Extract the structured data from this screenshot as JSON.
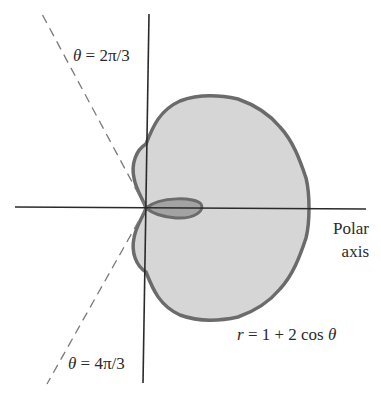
{
  "diagram": {
    "type": "polar-curve",
    "equation_label": "r = 1 + 2 cos θ",
    "equation": {
      "r_var": "r",
      "eq": " = 1 + 2 cos ",
      "theta": "θ"
    },
    "axis_label": {
      "line1": "Polar",
      "line2": "axis"
    },
    "rays": [
      {
        "name": "upper-ray",
        "label": {
          "theta": "θ",
          "rest": " = 2π/3"
        },
        "angle": "2π/3"
      },
      {
        "name": "lower-ray",
        "label": {
          "theta": "θ",
          "rest": " = 4π/3"
        },
        "angle": "4π/3"
      }
    ],
    "colors": {
      "outer_fill": "#d6d6d6",
      "inner_fill": "#a3a3a3",
      "curve_stroke": "#6b6b6b",
      "axis": "#2a2a2a",
      "dashed_ray": "#7a7a7a"
    }
  }
}
